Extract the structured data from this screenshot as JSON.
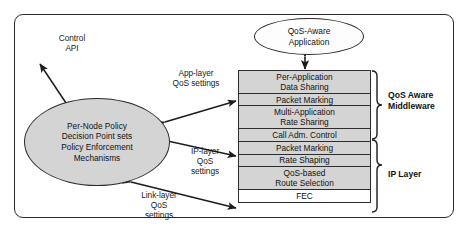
{
  "diagram": {
    "frame": {
      "style": "rounded-rectangle"
    },
    "colors": {
      "box_fill": "#d4d4d4",
      "box_fill_alt": "#ffffff",
      "stroke": "#2b2b2b",
      "text": "#111111"
    },
    "nodes": {
      "app_ellipse": "QoS-Aware\nApplication",
      "policy_ellipse": "Per-Node Policy\nDecision Point sets\nPolicy Enforcement\nMechanisms"
    },
    "labels": {
      "control_api": "Control\nAPI",
      "app_layer": "App-layer\nQoS settings",
      "ip_layer_settings": "IP-layer\nQoS\nsettings",
      "link_layer_settings": "Link-layer\nQoS\nsettings",
      "middleware_group": "QoS Aware\nMiddleware",
      "ip_layer_group": "IP Layer"
    },
    "middleware_stack": [
      {
        "label": "Per-Application\nData Sharing",
        "lines": 2,
        "fill": "gray"
      },
      {
        "label": "Packet Marking",
        "lines": 1,
        "fill": "gray"
      },
      {
        "label": "Multi-Application\nRate Sharing",
        "lines": 2,
        "fill": "gray"
      }
    ],
    "ip_stack": [
      {
        "label": "Call Adm. Control",
        "lines": 1,
        "fill": "gray"
      },
      {
        "label": "Packet Marking",
        "lines": 1,
        "fill": "gray"
      },
      {
        "label": "Rate Shaping",
        "lines": 1,
        "fill": "gray"
      },
      {
        "label": "QoS-based\nRoute Selection",
        "lines": 2,
        "fill": "gray"
      },
      {
        "label": "FEC",
        "lines": 1,
        "fill": "white"
      }
    ],
    "connectors": [
      {
        "name": "control-api-arrow",
        "type": "double-headed",
        "from": "policy_ellipse",
        "to": "outside-top-left"
      },
      {
        "name": "app-ellipse-to-stack-arrow",
        "type": "double-headed",
        "from": "app_ellipse",
        "to": "per-application-data-sharing"
      },
      {
        "name": "app-layer-arrow",
        "type": "double-headed",
        "from": "policy_ellipse",
        "to": "packet-marking-middleware"
      },
      {
        "name": "ip-layer-arrow",
        "type": "double-headed",
        "from": "policy_ellipse",
        "to": "packet-marking-ip"
      },
      {
        "name": "link-layer-arrow",
        "type": "double-headed",
        "from": "policy_ellipse",
        "to": "fec"
      }
    ]
  }
}
